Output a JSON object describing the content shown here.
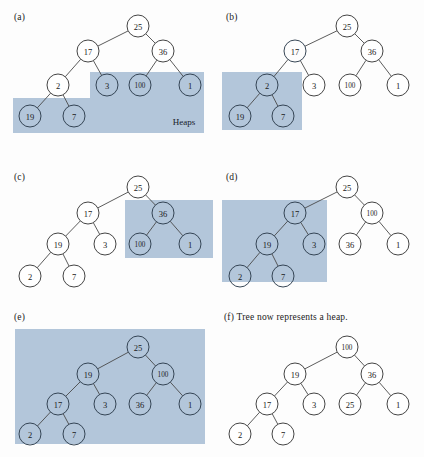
{
  "figure": {
    "width": 424,
    "height": 457,
    "shade_color": "#b3c6da",
    "node_fill": "#ffffff",
    "node_stroke": "#3a3a3a",
    "edge_color": "#4a4a4a",
    "background": "#fdfdfd"
  },
  "panels": [
    {
      "id": "a",
      "label": "(a)",
      "label_pos": {
        "x": 14,
        "y": 12
      },
      "annotation": {
        "text": "Heaps",
        "x": 184,
        "y": 122
      },
      "shades": [
        {
          "x": 90,
          "y": 72,
          "w": 114,
          "h": 27
        },
        {
          "x": 13,
          "y": 98,
          "w": 191,
          "h": 35
        }
      ],
      "nodes": [
        {
          "id": "n25",
          "value": "25",
          "x": 138,
          "y": 26,
          "shaded": false
        },
        {
          "id": "n17",
          "value": "17",
          "x": 88,
          "y": 51,
          "shaded": false
        },
        {
          "id": "n36",
          "value": "36",
          "x": 163,
          "y": 51,
          "shaded": false
        },
        {
          "id": "n2",
          "value": "2",
          "x": 58,
          "y": 85,
          "shaded": false
        },
        {
          "id": "n3",
          "value": "3",
          "x": 107,
          "y": 85,
          "shaded": true
        },
        {
          "id": "n100",
          "value": "100",
          "x": 140,
          "y": 85,
          "shaded": true
        },
        {
          "id": "n1",
          "value": "1",
          "x": 190,
          "y": 85,
          "shaded": true
        },
        {
          "id": "n19",
          "value": "19",
          "x": 30,
          "y": 116,
          "shaded": true
        },
        {
          "id": "n7",
          "value": "7",
          "x": 74,
          "y": 116,
          "shaded": true
        }
      ],
      "edges": [
        [
          "n25",
          "n17"
        ],
        [
          "n25",
          "n36"
        ],
        [
          "n17",
          "n2"
        ],
        [
          "n17",
          "n3"
        ],
        [
          "n36",
          "n100"
        ],
        [
          "n36",
          "n1"
        ],
        [
          "n2",
          "n19"
        ],
        [
          "n2",
          "n7"
        ]
      ]
    },
    {
      "id": "b",
      "label": "(b)",
      "label_pos": {
        "x": 226,
        "y": 12
      },
      "annotation": null,
      "shades": [
        {
          "x": 222,
          "y": 72,
          "w": 80,
          "h": 58
        }
      ],
      "nodes": [
        {
          "id": "n25",
          "value": "25",
          "x": 347,
          "y": 26,
          "shaded": false
        },
        {
          "id": "n17",
          "value": "17",
          "x": 295,
          "y": 51,
          "shaded": true
        },
        {
          "id": "n36",
          "value": "36",
          "x": 372,
          "y": 51,
          "shaded": false
        },
        {
          "id": "n2",
          "value": "2",
          "x": 267,
          "y": 85,
          "shaded": true
        },
        {
          "id": "n3",
          "value": "3",
          "x": 314,
          "y": 85,
          "shaded": false
        },
        {
          "id": "n100",
          "value": "100",
          "x": 350,
          "y": 85,
          "shaded": false
        },
        {
          "id": "n1",
          "value": "1",
          "x": 398,
          "y": 85,
          "shaded": false
        },
        {
          "id": "n19",
          "value": "19",
          "x": 240,
          "y": 116,
          "shaded": true
        },
        {
          "id": "n7",
          "value": "7",
          "x": 283,
          "y": 116,
          "shaded": true
        }
      ],
      "edges": [
        [
          "n25",
          "n17"
        ],
        [
          "n25",
          "n36"
        ],
        [
          "n17",
          "n2"
        ],
        [
          "n17",
          "n3"
        ],
        [
          "n36",
          "n100"
        ],
        [
          "n36",
          "n1"
        ],
        [
          "n2",
          "n19"
        ],
        [
          "n2",
          "n7"
        ]
      ]
    },
    {
      "id": "c",
      "label": "(c)",
      "label_pos": {
        "x": 14,
        "y": 172
      },
      "annotation": null,
      "shades": [
        {
          "x": 125,
          "y": 200,
          "w": 88,
          "h": 58
        }
      ],
      "nodes": [
        {
          "id": "n25",
          "value": "25",
          "x": 138,
          "y": 187,
          "shaded": false
        },
        {
          "id": "n17",
          "value": "17",
          "x": 88,
          "y": 213,
          "shaded": false
        },
        {
          "id": "n36",
          "value": "36",
          "x": 163,
          "y": 213,
          "shaded": true
        },
        {
          "id": "n19",
          "value": "19",
          "x": 58,
          "y": 244,
          "shaded": false
        },
        {
          "id": "n3",
          "value": "3",
          "x": 105,
          "y": 244,
          "shaded": false
        },
        {
          "id": "n100",
          "value": "100",
          "x": 140,
          "y": 244,
          "shaded": true
        },
        {
          "id": "n1",
          "value": "1",
          "x": 190,
          "y": 244,
          "shaded": true
        },
        {
          "id": "n2",
          "value": "2",
          "x": 30,
          "y": 276,
          "shaded": false
        },
        {
          "id": "n7",
          "value": "7",
          "x": 74,
          "y": 276,
          "shaded": false
        }
      ],
      "edges": [
        [
          "n25",
          "n17"
        ],
        [
          "n25",
          "n36"
        ],
        [
          "n17",
          "n19"
        ],
        [
          "n17",
          "n3"
        ],
        [
          "n36",
          "n100"
        ],
        [
          "n36",
          "n1"
        ],
        [
          "n19",
          "n2"
        ],
        [
          "n19",
          "n7"
        ]
      ]
    },
    {
      "id": "d",
      "label": "(d)",
      "label_pos": {
        "x": 226,
        "y": 172
      },
      "annotation": null,
      "shades": [
        {
          "x": 222,
          "y": 200,
          "w": 105,
          "h": 82
        }
      ],
      "nodes": [
        {
          "id": "n25",
          "value": "25",
          "x": 347,
          "y": 187,
          "shaded": false
        },
        {
          "id": "n17",
          "value": "17",
          "x": 295,
          "y": 213,
          "shaded": true
        },
        {
          "id": "n100",
          "value": "100",
          "x": 372,
          "y": 213,
          "shaded": false
        },
        {
          "id": "n19",
          "value": "19",
          "x": 267,
          "y": 244,
          "shaded": true
        },
        {
          "id": "n3",
          "value": "3",
          "x": 314,
          "y": 244,
          "shaded": true
        },
        {
          "id": "n36",
          "value": "36",
          "x": 350,
          "y": 244,
          "shaded": false
        },
        {
          "id": "n1",
          "value": "1",
          "x": 398,
          "y": 244,
          "shaded": false
        },
        {
          "id": "n2",
          "value": "2",
          "x": 240,
          "y": 276,
          "shaded": true
        },
        {
          "id": "n7",
          "value": "7",
          "x": 283,
          "y": 276,
          "shaded": true
        }
      ],
      "edges": [
        [
          "n25",
          "n17"
        ],
        [
          "n25",
          "n100"
        ],
        [
          "n17",
          "n19"
        ],
        [
          "n17",
          "n3"
        ],
        [
          "n100",
          "n36"
        ],
        [
          "n100",
          "n1"
        ],
        [
          "n19",
          "n2"
        ],
        [
          "n19",
          "n7"
        ]
      ]
    },
    {
      "id": "e",
      "label": "(e)",
      "label_pos": {
        "x": 14,
        "y": 312
      },
      "annotation": null,
      "shades": [
        {
          "x": 15,
          "y": 329,
          "w": 190,
          "h": 115
        }
      ],
      "nodes": [
        {
          "id": "n25",
          "value": "25",
          "x": 138,
          "y": 347,
          "shaded": true
        },
        {
          "id": "n19",
          "value": "19",
          "x": 88,
          "y": 374,
          "shaded": true
        },
        {
          "id": "n100",
          "value": "100",
          "x": 163,
          "y": 374,
          "shaded": true
        },
        {
          "id": "n17",
          "value": "17",
          "x": 58,
          "y": 404,
          "shaded": true
        },
        {
          "id": "n3",
          "value": "3",
          "x": 105,
          "y": 404,
          "shaded": true
        },
        {
          "id": "n36",
          "value": "36",
          "x": 140,
          "y": 404,
          "shaded": true
        },
        {
          "id": "n1",
          "value": "1",
          "x": 190,
          "y": 404,
          "shaded": true
        },
        {
          "id": "n2",
          "value": "2",
          "x": 30,
          "y": 434,
          "shaded": true
        },
        {
          "id": "n7",
          "value": "7",
          "x": 74,
          "y": 434,
          "shaded": true
        }
      ],
      "edges": [
        [
          "n25",
          "n19"
        ],
        [
          "n25",
          "n100"
        ],
        [
          "n19",
          "n17"
        ],
        [
          "n19",
          "n3"
        ],
        [
          "n100",
          "n36"
        ],
        [
          "n100",
          "n1"
        ],
        [
          "n17",
          "n2"
        ],
        [
          "n17",
          "n7"
        ]
      ]
    },
    {
      "id": "f",
      "label": "(f) Tree now represents a heap.",
      "label_pos": {
        "x": 224,
        "y": 312
      },
      "annotation": null,
      "shades": [],
      "nodes": [
        {
          "id": "n100",
          "value": "100",
          "x": 347,
          "y": 347,
          "shaded": false
        },
        {
          "id": "n19",
          "value": "19",
          "x": 295,
          "y": 374,
          "shaded": false
        },
        {
          "id": "n36",
          "value": "36",
          "x": 372,
          "y": 374,
          "shaded": false
        },
        {
          "id": "n17",
          "value": "17",
          "x": 267,
          "y": 404,
          "shaded": false
        },
        {
          "id": "n3",
          "value": "3",
          "x": 314,
          "y": 404,
          "shaded": false
        },
        {
          "id": "n25",
          "value": "25",
          "x": 350,
          "y": 404,
          "shaded": false
        },
        {
          "id": "n1",
          "value": "1",
          "x": 398,
          "y": 404,
          "shaded": false
        },
        {
          "id": "n2",
          "value": "2",
          "x": 240,
          "y": 434,
          "shaded": false
        },
        {
          "id": "n7",
          "value": "7",
          "x": 283,
          "y": 434,
          "shaded": false
        }
      ],
      "edges": [
        [
          "n100",
          "n19"
        ],
        [
          "n100",
          "n36"
        ],
        [
          "n19",
          "n17"
        ],
        [
          "n19",
          "n3"
        ],
        [
          "n36",
          "n25"
        ],
        [
          "n36",
          "n1"
        ],
        [
          "n17",
          "n2"
        ],
        [
          "n17",
          "n7"
        ]
      ]
    }
  ],
  "node_radius": 11
}
